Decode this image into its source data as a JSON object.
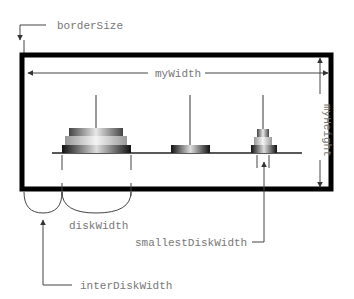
{
  "diagram": {
    "labels": {
      "border_size": "borderSize",
      "my_width": "myWidth",
      "my_height": "myHeight",
      "disk_width": "diskWidth",
      "smallest_disk_width": "smallestDiskWidth",
      "inter_disk_width": "interDiskWidth"
    },
    "pegs": [
      {
        "name": "peg-1",
        "disks": 3
      },
      {
        "name": "peg-2",
        "disks": 1
      },
      {
        "name": "peg-3",
        "disks": 3
      }
    ],
    "colors": {
      "border": "#000000",
      "annotation": "#777777"
    }
  }
}
